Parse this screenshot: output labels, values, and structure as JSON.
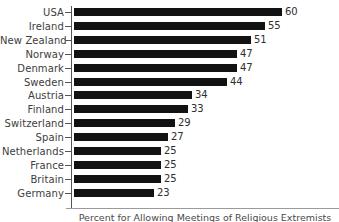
{
  "chart_data": {
    "type": "bar",
    "orientation": "horizontal",
    "title": "",
    "xlabel": "Percent for Allowing Meetings of Religious Extremists",
    "ylabel": "",
    "xlim": [
      0,
      60
    ],
    "grid": false,
    "legend": null,
    "categories": [
      "USA",
      "Ireland",
      "New Zealand",
      "Norway",
      "Denmark",
      "Sweden",
      "Austria",
      "Finland",
      "Switzerland",
      "Spain",
      "Netherlands",
      "France",
      "Britain",
      "Germany"
    ],
    "values": [
      60,
      55,
      51,
      47,
      47,
      44,
      34,
      33,
      29,
      27,
      25,
      25,
      25,
      23
    ],
    "bar_color": "#121212",
    "axis_color": "#555555",
    "label_color": "#3d3d3d",
    "value_label_color": "#2e2e2e"
  },
  "caption": {
    "text": "Percent for Allowing Meetings of Religious Extremists"
  }
}
